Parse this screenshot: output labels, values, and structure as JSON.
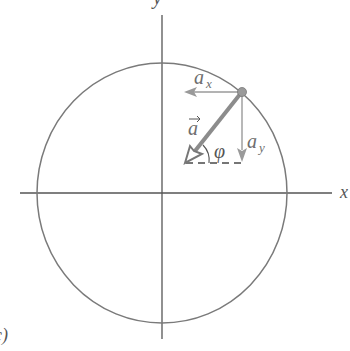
{
  "figure": {
    "panel_label": "c)",
    "axes": {
      "x_label": "x",
      "y_label": "y",
      "origin": [
        162,
        193
      ]
    },
    "circle": {
      "center": [
        162,
        193
      ],
      "rx": 125,
      "ry": 130
    },
    "particle": {
      "position": [
        242,
        92
      ]
    },
    "vectors": {
      "acceleration": {
        "label": "a",
        "has_arrow_over": true,
        "from": [
          242,
          92
        ],
        "to": [
          185,
          163
        ]
      },
      "ax": {
        "label": "a",
        "subscript": "x",
        "from": [
          242,
          92
        ],
        "to": [
          185,
          92
        ]
      },
      "ay": {
        "label": "a",
        "subscript": "y",
        "from": [
          242,
          92
        ],
        "to": [
          242,
          162
        ]
      }
    },
    "angle": {
      "label": "φ"
    },
    "colors": {
      "axis": "#555555",
      "circle": "#7a7a7a",
      "vector": "#8c8c8c",
      "component": "#9a9a9a",
      "text": "#6e6e6e"
    }
  }
}
